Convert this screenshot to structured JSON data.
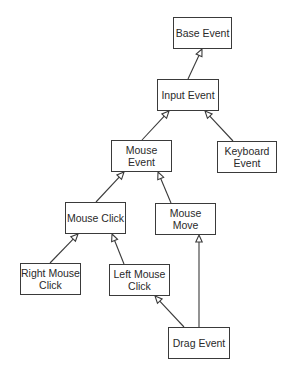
{
  "diagram": {
    "type": "class-hierarchy",
    "nodes": [
      {
        "id": "base_event",
        "label": "Base Event",
        "x": 173,
        "y": 17,
        "w": 59,
        "h": 32
      },
      {
        "id": "input_event",
        "label": "Input Event",
        "x": 157,
        "y": 79,
        "w": 62,
        "h": 32
      },
      {
        "id": "mouse_event",
        "label": "Mouse Event",
        "x": 111,
        "y": 140,
        "w": 61,
        "h": 32
      },
      {
        "id": "keyboard_event",
        "label": "Keyboard\nEvent",
        "x": 217,
        "y": 141,
        "w": 60,
        "h": 32
      },
      {
        "id": "mouse_click",
        "label": "Mouse Click",
        "x": 65,
        "y": 202,
        "w": 61,
        "h": 32
      },
      {
        "id": "mouse_move",
        "label": "Mouse Move",
        "x": 155,
        "y": 203,
        "w": 61,
        "h": 32
      },
      {
        "id": "right_mouse_click",
        "label": "Right Mouse\nClick",
        "x": 20,
        "y": 263,
        "w": 61,
        "h": 32
      },
      {
        "id": "left_mouse_click",
        "label": "Left Mouse\nClick",
        "x": 109,
        "y": 264,
        "w": 61,
        "h": 32
      },
      {
        "id": "drag_event",
        "label": "Drag Event",
        "x": 168,
        "y": 327,
        "w": 62,
        "h": 32
      }
    ],
    "edges": [
      {
        "from": "input_event",
        "to": "base_event",
        "x1": 188,
        "y1": 79,
        "x2": 202,
        "y2": 49,
        "arrow": "hollow-triangle"
      },
      {
        "from": "mouse_event",
        "to": "input_event",
        "x1": 142,
        "y1": 140,
        "x2": 169,
        "y2": 111,
        "arrow": "hollow-triangle"
      },
      {
        "from": "keyboard_event",
        "to": "input_event",
        "x1": 233,
        "y1": 141,
        "x2": 205,
        "y2": 111,
        "arrow": "hollow-triangle"
      },
      {
        "from": "mouse_click",
        "to": "mouse_event",
        "x1": 96,
        "y1": 202,
        "x2": 124,
        "y2": 172,
        "arrow": "hollow-triangle"
      },
      {
        "from": "mouse_move",
        "to": "mouse_event",
        "x1": 171,
        "y1": 203,
        "x2": 158,
        "y2": 172,
        "arrow": "hollow-triangle"
      },
      {
        "from": "right_mouse_click",
        "to": "mouse_click",
        "x1": 50,
        "y1": 263,
        "x2": 78,
        "y2": 234,
        "arrow": "hollow-triangle"
      },
      {
        "from": "left_mouse_click",
        "to": "mouse_click",
        "x1": 124,
        "y1": 264,
        "x2": 112,
        "y2": 234,
        "arrow": "hollow-triangle"
      },
      {
        "from": "drag_event",
        "to": "left_mouse_click",
        "x1": 184,
        "y1": 327,
        "x2": 155,
        "y2": 296,
        "arrow": "hollow-triangle"
      },
      {
        "from": "drag_event",
        "to": "mouse_move",
        "x1": 199,
        "y1": 327,
        "x2": 199,
        "y2": 235,
        "arrow": "hollow-triangle"
      }
    ],
    "colors": {
      "line": "#3a3a3a",
      "text": "#2a2a2a",
      "background": "#ffffff"
    }
  }
}
